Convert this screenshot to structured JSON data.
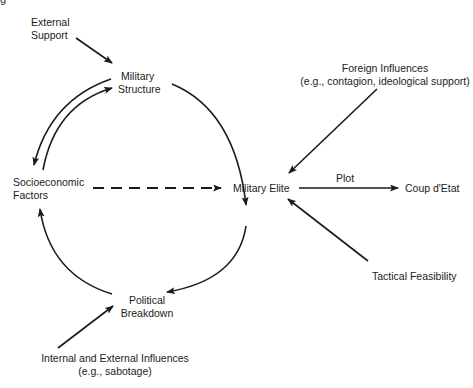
{
  "diagram": {
    "type": "causal-flow",
    "title_fragment": "g",
    "nodes": {
      "external_support": {
        "line1": "External",
        "line2": "Support"
      },
      "military_structure": {
        "line1": "Military",
        "line2": "Structure"
      },
      "socioeconomic_factors": {
        "line1": "Socioeconomic",
        "line2": "Factors"
      },
      "military_elite": {
        "label": "Military Elite"
      },
      "coup": {
        "label": "Coup d'Etat"
      },
      "political_breakdown": {
        "line1": "Political",
        "line2": "Breakdown"
      },
      "foreign_influences": {
        "line1": "Foreign Influences",
        "line2": "(e.g., contagion, ideological support)"
      },
      "tactical_feasibility": {
        "label": "Tactical Feasibility"
      },
      "internal_external": {
        "line1": "Internal and External Influences",
        "line2": "(e.g., sabotage)"
      }
    },
    "edges": [
      {
        "from": "External Support",
        "to": "Military Structure",
        "style": "solid"
      },
      {
        "from": "Military Structure",
        "to": "Socioeconomic Factors",
        "style": "solid"
      },
      {
        "from": "Socioeconomic Factors",
        "to": "Military Structure",
        "style": "solid"
      },
      {
        "from": "Military Structure",
        "to": "Military Elite",
        "style": "solid"
      },
      {
        "from": "Socioeconomic Factors",
        "to": "Military Elite",
        "style": "dashed"
      },
      {
        "from": "Military Elite",
        "to": "Political Breakdown",
        "style": "solid"
      },
      {
        "from": "Political Breakdown",
        "to": "Socioeconomic Factors",
        "style": "solid"
      },
      {
        "from": "Internal and External Influences",
        "to": "Political Breakdown",
        "style": "solid"
      },
      {
        "from": "Foreign Influences",
        "to": "Military Elite",
        "style": "solid"
      },
      {
        "from": "Tactical Feasibility",
        "to": "Military Elite",
        "style": "solid"
      },
      {
        "from": "Military Elite",
        "to": "Coup d'Etat",
        "style": "solid",
        "label": "Plot"
      }
    ],
    "edge_labels": {
      "plot": "Plot"
    },
    "colors": {
      "ink": "#1a1a1a",
      "background": "#ffffff"
    }
  }
}
